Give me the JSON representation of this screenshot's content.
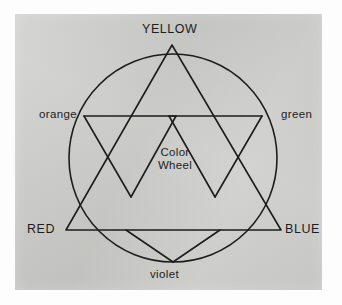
{
  "figure": {
    "title": "Color Wheel",
    "center_label_line1": "Color",
    "center_label_line2": "Wheel",
    "panel_color": "#c9c9c6",
    "ink_color": "#1d1d1d",
    "page_color": "#fdfdfd"
  },
  "primaries": [
    {
      "name": "yellow",
      "label": "YELLOW",
      "position": "top"
    },
    {
      "name": "red",
      "label": "RED",
      "position": "bottom-left"
    },
    {
      "name": "blue",
      "label": "BLUE",
      "position": "bottom-right"
    }
  ],
  "secondaries": [
    {
      "name": "orange",
      "label": "orange",
      "position": "upper-left"
    },
    {
      "name": "green",
      "label": "green",
      "position": "upper-right"
    },
    {
      "name": "violet",
      "label": "violet",
      "position": "bottom"
    }
  ],
  "geometry": {
    "circle": {
      "cx": 173,
      "cy": 158,
      "r": 104
    },
    "triangle": {
      "apex": [
        172,
        45
      ],
      "left": [
        66,
        230
      ],
      "right": [
        281,
        230
      ]
    },
    "stroke_width": 1.6
  }
}
